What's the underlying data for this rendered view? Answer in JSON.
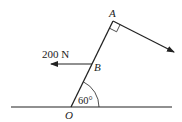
{
  "diagram": {
    "labels": {
      "point_a": "A",
      "point_b": "B",
      "point_o": "O",
      "force": "200 N",
      "angle": "60°"
    },
    "colors": {
      "stroke": "#222222",
      "background": "#ffffff"
    }
  }
}
